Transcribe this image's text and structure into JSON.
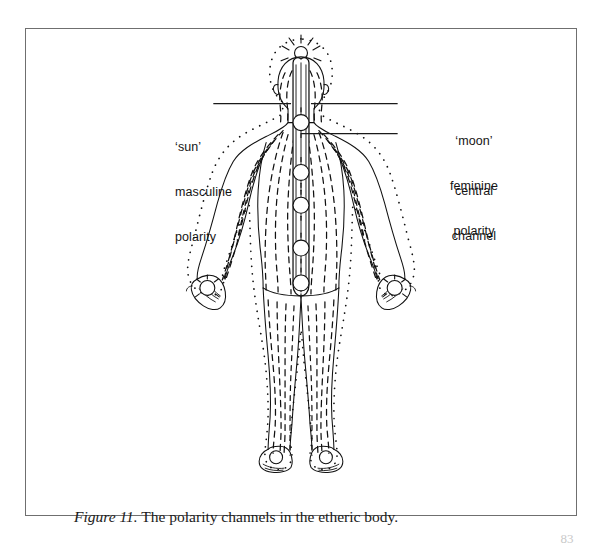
{
  "figure": {
    "caption_number": "Figure 11.",
    "caption_text": " The polarity channels in the etheric body.",
    "page_number": "83",
    "frame_color": "#6f6f6f",
    "ink_color": "#111111",
    "background_color": "#ffffff"
  },
  "labels": {
    "sun": {
      "line1": "‘sun’",
      "line2": "masculine",
      "line3": "polarity"
    },
    "moon": {
      "line1": "‘moon’",
      "line2": "feminine",
      "line3": "polarity"
    },
    "central": {
      "line1": "central",
      "line2": "channel"
    }
  },
  "diagram": {
    "leaders": [
      {
        "name": "sun-leader",
        "x1": 213,
        "y1": 103,
        "x2": 290,
        "y2": 103
      },
      {
        "name": "moon-leader",
        "x1": 312,
        "y1": 103,
        "x2": 398,
        "y2": 103
      },
      {
        "name": "central-channel-leader",
        "x1": 301,
        "y1": 133,
        "x2": 398,
        "y2": 133
      }
    ],
    "chakras": [
      {
        "name": "crown-chakra",
        "cx": 301,
        "cy": 52,
        "r": 7
      },
      {
        "name": "throat-chakra",
        "cx": 301,
        "cy": 122,
        "r": 8
      },
      {
        "name": "heart-chakra",
        "cx": 301,
        "cy": 172,
        "r": 8
      },
      {
        "name": "solar-plexus-chakra",
        "cx": 301,
        "cy": 205,
        "r": 8
      },
      {
        "name": "sacral-chakra",
        "cx": 301,
        "cy": 248,
        "r": 8
      },
      {
        "name": "root-chakra",
        "cx": 301,
        "cy": 283,
        "r": 8
      },
      {
        "name": "left-palm-chakra",
        "cx": 213,
        "cy": 272,
        "r": 8
      },
      {
        "name": "right-palm-chakra",
        "cx": 389,
        "cy": 272,
        "r": 8
      },
      {
        "name": "left-foot-chakra",
        "cx": 272,
        "cy": 447,
        "r": 7
      },
      {
        "name": "right-foot-chakra",
        "cx": 330,
        "cy": 447,
        "r": 7
      }
    ]
  }
}
